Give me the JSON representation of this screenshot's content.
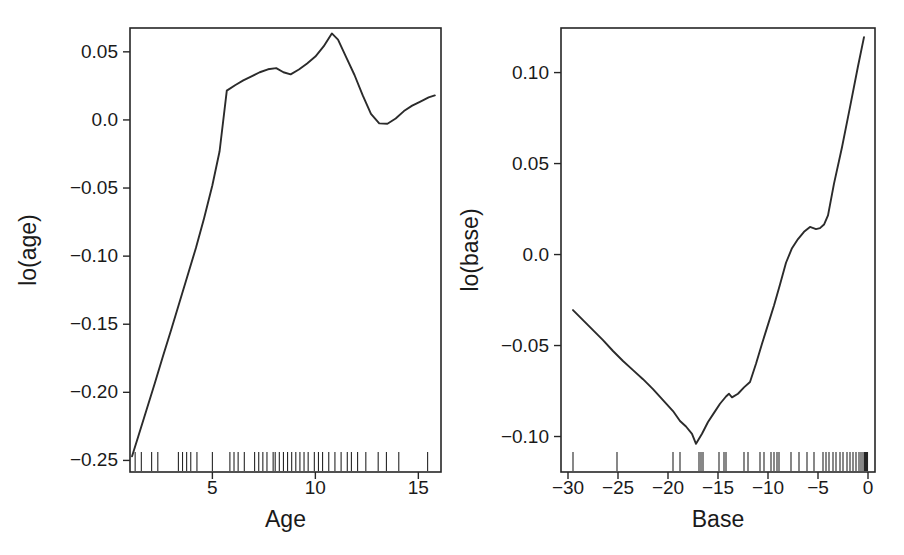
{
  "figure": {
    "background": "#ffffff",
    "ink_color": "#262626",
    "panel_count": 2
  },
  "chart_data": [
    {
      "type": "line",
      "id": "lo-age",
      "title": "",
      "xlabel": "Age",
      "ylabel": "lo(age)",
      "xlim": [
        1.0,
        16.1
      ],
      "ylim": [
        -0.2585,
        0.0675
      ],
      "grid": false,
      "legend": null,
      "xticks": [
        5,
        10,
        15
      ],
      "xticklabels": [
        "5",
        "10",
        "15"
      ],
      "yticks": [
        0.05,
        0.0,
        -0.05,
        -0.1,
        -0.15,
        -0.2,
        -0.25
      ],
      "yticklabels": [
        "0.05",
        "0.0",
        "−0.05",
        "−0.10",
        "−0.15",
        "−0.20",
        "−0.25"
      ],
      "x": [
        1.1,
        1.4,
        1.8,
        2.2,
        2.6,
        3.0,
        3.4,
        3.8,
        4.2,
        4.6,
        5.0,
        5.35,
        5.7,
        6.1,
        6.5,
        6.9,
        7.3,
        7.7,
        8.1,
        8.45,
        8.8,
        9.2,
        9.6,
        10.0,
        10.4,
        10.8,
        11.1,
        11.5,
        11.9,
        12.3,
        12.7,
        13.1,
        13.5,
        13.9,
        14.3,
        14.7,
        15.1,
        15.5,
        15.8
      ],
      "y": [
        -0.247,
        -0.2325,
        -0.213,
        -0.1935,
        -0.1735,
        -0.154,
        -0.134,
        -0.114,
        -0.094,
        -0.072,
        -0.048,
        -0.023,
        0.0215,
        0.0255,
        0.029,
        0.032,
        0.035,
        0.0372,
        0.038,
        0.035,
        0.0335,
        0.037,
        0.0415,
        0.0465,
        0.054,
        0.0635,
        0.059,
        0.046,
        0.033,
        0.018,
        0.0045,
        -0.0025,
        -0.0028,
        0.001,
        0.0065,
        0.0105,
        0.0135,
        0.0165,
        0.018
      ],
      "rug_label": "Age observations (rug)",
      "rug": [
        1.25,
        1.55,
        2.05,
        2.35,
        3.35,
        3.55,
        3.75,
        3.95,
        4.25,
        5.0,
        5.85,
        6.05,
        6.25,
        6.55,
        7.05,
        7.25,
        7.45,
        7.65,
        7.95,
        8.05,
        8.25,
        8.45,
        8.65,
        8.85,
        9.05,
        9.25,
        9.45,
        9.65,
        9.95,
        10.15,
        10.35,
        10.65,
        10.95,
        11.25,
        11.55,
        11.75,
        12.05,
        12.45,
        13.05,
        13.45,
        14.05,
        15.45
      ]
    },
    {
      "type": "line",
      "id": "lo-base",
      "title": "",
      "xlabel": "Base",
      "ylabel": "lo(base)",
      "xlim": [
        -30.7,
        0.7
      ],
      "ylim": [
        -0.1195,
        0.1245
      ],
      "grid": false,
      "legend": null,
      "xticks": [
        -30,
        -25,
        -20,
        -15,
        -10,
        -5,
        0
      ],
      "xticklabels": [
        "−30",
        "−25",
        "−20",
        "−15",
        "−10",
        "−5",
        "0"
      ],
      "yticks": [
        0.1,
        0.05,
        0.0,
        -0.05,
        -0.1
      ],
      "yticklabels": [
        "0.10",
        "0.05",
        "0.0",
        "−0.05",
        "−0.10"
      ],
      "x": [
        -29.5,
        -28.5,
        -27.5,
        -26.5,
        -25.5,
        -24.5,
        -23.5,
        -22.5,
        -21.5,
        -20.5,
        -19.5,
        -18.8,
        -18.2,
        -17.6,
        -17.2,
        -16.6,
        -16.0,
        -15.4,
        -14.8,
        -14.2,
        -13.9,
        -13.6,
        -13.0,
        -12.4,
        -11.8,
        -11.2,
        -10.6,
        -10.0,
        -9.4,
        -8.8,
        -8.2,
        -7.6,
        -7.0,
        -6.4,
        -5.8,
        -5.2,
        -4.8,
        -4.4,
        -4.0,
        -3.4,
        -2.6,
        -1.8,
        -1.0,
        -0.4
      ],
      "y": [
        -0.0305,
        -0.036,
        -0.0415,
        -0.047,
        -0.053,
        -0.0585,
        -0.0635,
        -0.0685,
        -0.074,
        -0.08,
        -0.086,
        -0.0915,
        -0.0945,
        -0.0985,
        -0.104,
        -0.0985,
        -0.092,
        -0.087,
        -0.082,
        -0.078,
        -0.0765,
        -0.0785,
        -0.0765,
        -0.073,
        -0.07,
        -0.06,
        -0.049,
        -0.0385,
        -0.028,
        -0.0165,
        -0.0045,
        0.0035,
        0.0085,
        0.0125,
        0.0152,
        0.014,
        0.0145,
        0.0165,
        0.0215,
        0.039,
        0.059,
        0.081,
        0.1035,
        0.1195
      ],
      "rug_label": "Base observations (rug)",
      "rug": [
        -29.5,
        -25.1,
        -19.5,
        -18.8,
        -16.9,
        -16.7,
        -16.5,
        -14.9,
        -14.4,
        -14.2,
        -12.4,
        -12.0,
        -10.8,
        -10.4,
        -9.7,
        -9.4,
        -9.1,
        -8.9,
        -7.7,
        -6.9,
        -6.1,
        -5.4,
        -4.5,
        -4.2,
        -3.9,
        -3.5,
        -3.2,
        -2.8,
        -2.5,
        -2.1,
        -1.8,
        -1.5,
        -1.2,
        -0.9,
        -0.7,
        -0.5,
        -0.35,
        -0.25,
        -0.15,
        -0.05
      ]
    }
  ]
}
